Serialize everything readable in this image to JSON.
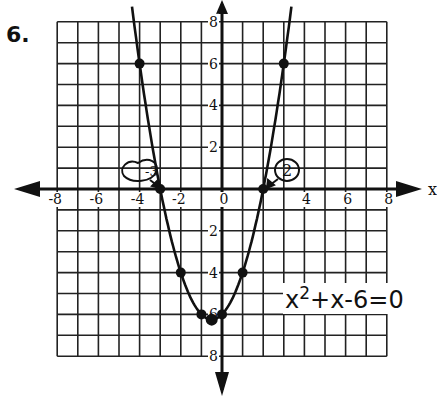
{
  "problem_number": "6.",
  "equation": {
    "base": "x",
    "exponent": "2",
    "rest": "+x-6=0"
  },
  "x_axis_letter": "x",
  "annotations": {
    "root_left": "-3",
    "root_right": "2"
  },
  "chart_data": {
    "type": "line",
    "xlabel": "x",
    "ylabel": "",
    "xlim": [
      -8,
      8
    ],
    "ylim": [
      -8,
      8
    ],
    "grid": true,
    "x_tick_labels": [
      "-8",
      "-6",
      "-4",
      "-2",
      "0",
      "4",
      "6",
      "8"
    ],
    "y_tick_labels_above": [
      "8",
      "6",
      "4",
      "2"
    ],
    "y_tick_labels_below": [
      "2",
      "4",
      "6",
      "8"
    ],
    "series": [
      {
        "name": "y = x^2 + x - 6",
        "points": [
          {
            "x": -4,
            "y": 6
          },
          {
            "x": -3,
            "y": 0
          },
          {
            "x": -2,
            "y": -4
          },
          {
            "x": -1,
            "y": -6
          },
          {
            "x": -0.5,
            "y": -6.25
          },
          {
            "x": 0,
            "y": -6
          },
          {
            "x": 1,
            "y": -4
          },
          {
            "x": 2,
            "y": 0
          },
          {
            "x": 3,
            "y": 6
          }
        ]
      }
    ],
    "roots": [
      -3,
      2
    ],
    "annotations": [
      {
        "text": "-3",
        "x": -3,
        "y": 0,
        "style": "circled with arrow"
      },
      {
        "text": "2",
        "x": 2,
        "y": 0,
        "style": "circled with arrow"
      }
    ]
  }
}
